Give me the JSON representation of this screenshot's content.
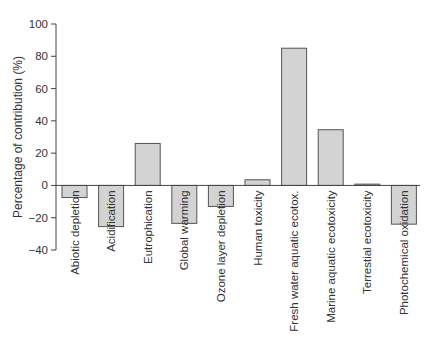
{
  "chart_data": {
    "type": "bar",
    "title": "",
    "xlabel": "",
    "ylabel": "Percentage of contribution (%)",
    "ylim": [
      -40,
      100
    ],
    "yticks": [
      -40,
      -20,
      0,
      20,
      40,
      60,
      80,
      100
    ],
    "grid": false,
    "legend": null,
    "categories": [
      "Abiotic depletion",
      "Acidification",
      "Eutrophication",
      "Global warming",
      "Ozone layer depletion",
      "Human toxicity",
      "Fresh water aquatic ecotox.",
      "Marine aquatic ecotoxicity",
      "Terrestial ecotoxicity",
      "Photochemical oxidation"
    ],
    "values": [
      -7.5,
      -25.5,
      26,
      -23.5,
      -13,
      3.5,
      85,
      34.5,
      0.8,
      -24
    ],
    "colors": {
      "bar_fill": "#d3d3d3",
      "bar_stroke": "#555555",
      "axis": "#444444"
    }
  }
}
